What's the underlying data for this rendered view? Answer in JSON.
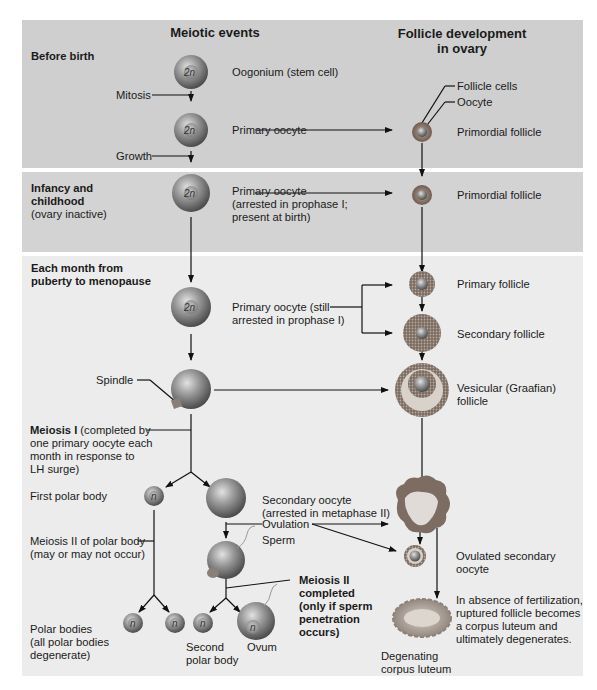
{
  "headers": {
    "meiotic_events": "Meiotic events",
    "follicle_dev_line1": "Follicle development",
    "follicle_dev_line2": "in ovary"
  },
  "stages": {
    "before_birth": "Before birth",
    "infancy_line1": "Infancy and",
    "infancy_line2": "childhood",
    "infancy_note": "(ovary inactive)",
    "monthly_line1": "Each month from",
    "monthly_line2": "puberty to menopause"
  },
  "cell_labels": {
    "diploid": "2n",
    "haploid": "n"
  },
  "meiotic": {
    "oogonium": "Oogonium (stem cell)",
    "mitosis": "Mitosis",
    "primary_oocyte": "Primary oocyte",
    "growth": "Growth",
    "primary_oocyte_arrested_l1": "Primary oocyte",
    "primary_oocyte_arrested_l2": "(arrested in prophase I;",
    "primary_oocyte_arrested_l3": "present at birth)",
    "primary_oocyte_still_l1": "Primary oocyte (still",
    "primary_oocyte_still_l2": "arrested in prophase I)",
    "spindle": "Spindle",
    "meiosis1_bold": "Meiosis I",
    "meiosis1_l1": " (completed by",
    "meiosis1_l2": "one primary oocyte each",
    "meiosis1_l3": "month in response to",
    "meiosis1_l4": "LH surge)",
    "first_polar_body": "First polar body",
    "secondary_oocyte_l1": "Secondary oocyte",
    "secondary_oocyte_l2": "(arrested in metaphase II)",
    "ovulation": "Ovulation",
    "sperm": "Sperm",
    "meiosis2_polar_l1": "Meiosis II of polar body",
    "meiosis2_polar_l2": "(may or may not occur)",
    "meiosis2_completed_l1": "Meiosis II",
    "meiosis2_completed_l2": "completed",
    "meiosis2_completed_l3": "(only if sperm",
    "meiosis2_completed_l4": "penetration",
    "meiosis2_completed_l5": "occurs)",
    "polar_bodies_l1": "Polar bodies",
    "polar_bodies_l2": "(all polar bodies",
    "polar_bodies_l3": "degenerate)",
    "second_polar_l1": "Second",
    "second_polar_l2": "polar body",
    "ovum": "Ovum"
  },
  "follicle": {
    "follicle_cells": "Follicle cells",
    "oocyte": "Oocyte",
    "primordial_1": "Primordial follicle",
    "primordial_2": "Primordial follicle",
    "primary": "Primary follicle",
    "secondary": "Secondary follicle",
    "vesicular_l1": "Vesicular (Graafian)",
    "vesicular_l2": "follicle",
    "ovulated_l1": "Ovulated secondary",
    "ovulated_l2": "oocyte",
    "absence_l1": "In absence of fertilization,",
    "absence_l2": "ruptured follicle becomes",
    "absence_l3": "a corpus luteum and",
    "absence_l4": "ultimately degenerates.",
    "degenerating_l1": "Degenating",
    "degenerating_l2": "corpus luteum"
  },
  "colors": {
    "band_before_birth": "#cfcfcf",
    "band_infancy": "#d3d3d3",
    "band_monthly": "#ececec",
    "cell_gray": "#8a8a8a",
    "follicle_cells": "#9a7f70",
    "corpus_luteum": "#c9c0b8"
  }
}
